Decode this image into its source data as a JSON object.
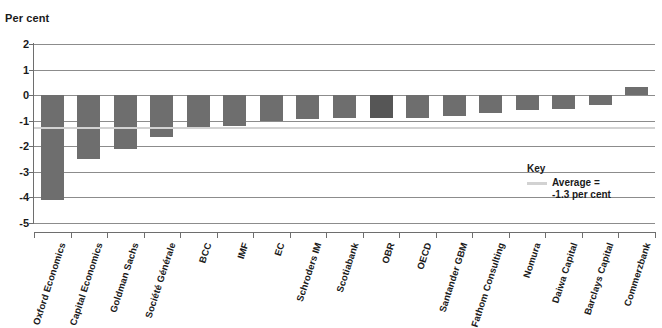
{
  "chart_data": {
    "type": "bar",
    "title": "",
    "ylabel": "Per cent",
    "xlabel": "",
    "ylim": [
      -5,
      2
    ],
    "yticks": [
      2,
      1,
      0,
      -1,
      -2,
      -3,
      -4,
      -5
    ],
    "ytick_labels": [
      "2",
      "1",
      "0",
      "-1",
      "-2",
      "-3",
      "-4",
      "-5"
    ],
    "grid": true,
    "legend_position": "inside-right",
    "categories": [
      "Oxford Economics",
      "Capital Economics",
      "Goldman Sachs",
      "Société Générale",
      "BCC",
      "IMF",
      "EC",
      "Schroders IM",
      "Scotiabank",
      "OBR",
      "OECD",
      "Santander GBM",
      "Fathom Consulting",
      "Nomura",
      "Daiwa Capital",
      "Barclays Capital",
      "Commerzbank"
    ],
    "values": [
      -4.1,
      -2.5,
      -2.1,
      -1.65,
      -1.3,
      -1.2,
      -1.0,
      -0.95,
      -0.9,
      -0.9,
      -0.9,
      -0.8,
      -0.7,
      -0.6,
      -0.55,
      -0.4,
      0.3
    ],
    "highlight_index": 9,
    "annotations": [
      {
        "name": "average-line",
        "value": -1.3,
        "label": "Average = -1.3 per cent"
      }
    ],
    "colors": {
      "bar": "#6e6e6e",
      "bar_highlight": "#565656",
      "gridline": "#8c8c8c",
      "average_line": "#d2d2d2",
      "axis": "#6e6e6e",
      "text": "#1a1a1a",
      "background": "#ffffff"
    }
  },
  "legend": {
    "title": "Key",
    "entry_label": "Average =\n-1.3 per cent"
  }
}
